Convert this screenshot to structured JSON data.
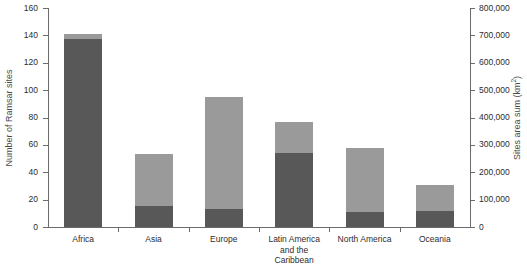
{
  "chart_data": {
    "type": "bar",
    "stacked": true,
    "title": "",
    "subtitle": "",
    "categories": [
      "Africa",
      "Asia",
      "Europe",
      "Latin America\nand the\nCaribbean",
      "North America",
      "Oceania"
    ],
    "series": [
      {
        "name": "Sites area sum (km2)",
        "axis": "right",
        "color": "#585858",
        "values": [
          137,
          15,
          13,
          54,
          11,
          12
        ],
        "area_values_km2": [
          685000,
          75000,
          65000,
          270000,
          55000,
          60000
        ]
      },
      {
        "name": "Number of Ramsar sites",
        "axis": "left",
        "color": "#9a9a9a",
        "values": [
          141,
          53,
          95,
          77,
          58,
          31
        ]
      }
    ],
    "totals": [
      141,
      53,
      95,
      77,
      58,
      31
    ],
    "xlabel": "",
    "ylabel": "Number of Ramsar sites",
    "y2label": "Sites area sum (km2)",
    "ylim": [
      0,
      160
    ],
    "y2lim": [
      0,
      800000
    ],
    "yticks": [
      0,
      20,
      40,
      60,
      80,
      100,
      120,
      140,
      160
    ],
    "y2ticks": [
      0,
      100000,
      200000,
      300000,
      400000,
      500000,
      600000,
      700000,
      800000
    ],
    "ytick_labels": [
      "0",
      "20",
      "40",
      "60",
      "80",
      "100",
      "120",
      "140",
      "160"
    ],
    "y2tick_labels": [
      "0",
      "100,000",
      "200,000",
      "300,000",
      "400,000",
      "500,000",
      "600,000",
      "700,000",
      "800,000"
    ],
    "grid": false,
    "legend": null
  },
  "axes": {
    "left_title": "Number of Ramsar sites",
    "right_title_main": "Sites area sum (km",
    "right_title_sup": "2",
    "right_title_tail": ")"
  },
  "colors": {
    "bar_light": "#9a9a9a",
    "bar_dark": "#585858",
    "axis": "#6b6b6b",
    "text": "#2d2d2d",
    "axis_title": "#4a4a4a",
    "background": "#ffffff"
  }
}
